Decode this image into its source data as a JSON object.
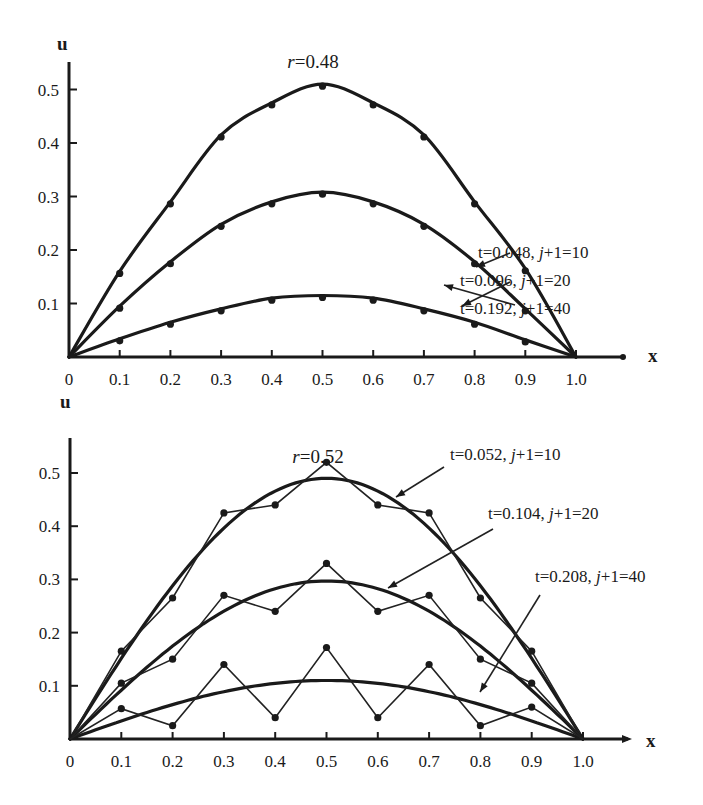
{
  "chart_data": [
    {
      "type": "line",
      "title": "r=0.48",
      "title_var": "r",
      "title_value": "=0.48",
      "xlabel": "x",
      "ylabel": "u",
      "xlim": [
        0,
        1.0
      ],
      "ylim": [
        0,
        0.55
      ],
      "x_ticks": [
        "0",
        "0.1",
        "0.2",
        "0.3",
        "0.4",
        "0.5",
        "0.6",
        "0.7",
        "0.8",
        "0.9",
        "1.0"
      ],
      "y_ticks": [
        "0.1",
        "0.2",
        "0.3",
        "0.4",
        "0.5"
      ],
      "grid": false,
      "x": [
        0,
        0.1,
        0.2,
        0.3,
        0.4,
        0.5,
        0.6,
        0.7,
        0.8,
        0.9,
        1.0
      ],
      "series": [
        {
          "name": "t=0.048, j+1=10",
          "label_t": "t=0.048, ",
          "label_j": "j",
          "label_rest": "+1=10",
          "kind": "exact+numeric",
          "values": [
            0,
            0.16,
            0.29,
            0.415,
            0.475,
            0.51,
            0.475,
            0.415,
            0.29,
            0.165,
            0
          ]
        },
        {
          "name": "t=0.096, j+1=20",
          "label_t": "t=0.096, ",
          "label_j": "j",
          "label_rest": "+1=20",
          "kind": "exact+numeric",
          "values": [
            0,
            0.095,
            0.178,
            0.248,
            0.29,
            0.308,
            0.29,
            0.248,
            0.178,
            0.09,
            0
          ]
        },
        {
          "name": "t=0.192, j+1=40",
          "label_t": "t=0.192, ",
          "label_j": "j",
          "label_rest": "+1=40",
          "kind": "exact+numeric",
          "values": [
            0,
            0.034,
            0.065,
            0.09,
            0.11,
            0.115,
            0.11,
            0.09,
            0.065,
            0.032,
            0
          ]
        }
      ]
    },
    {
      "type": "line",
      "title": "r=0.52",
      "title_var": "r",
      "title_value": "=0.52",
      "xlabel": "x",
      "ylabel": "u",
      "xlim": [
        0,
        1.0
      ],
      "ylim": [
        0,
        0.55
      ],
      "x_ticks": [
        "0",
        "0.1",
        "0.2",
        "0.3",
        "0.4",
        "0.5",
        "0.6",
        "0.7",
        "0.8",
        "0.9",
        "1.0"
      ],
      "y_ticks": [
        "0.1",
        "0.2",
        "0.3",
        "0.4",
        "0.5"
      ],
      "grid": false,
      "x": [
        0,
        0.1,
        0.2,
        0.3,
        0.4,
        0.5,
        0.6,
        0.7,
        0.8,
        0.9,
        1.0
      ],
      "series": [
        {
          "name": "t=0.052, j+1=10",
          "label_t": "t=0.052, ",
          "label_j": "j",
          "label_rest": "+1=10",
          "kind": "exact",
          "exact_peak": 0.49,
          "numeric_values": [
            0,
            0.165,
            0.265,
            0.425,
            0.44,
            0.52,
            0.44,
            0.425,
            0.265,
            0.165,
            0
          ]
        },
        {
          "name": "t=0.104, j+1=20",
          "label_t": "t=0.104, ",
          "label_j": "j",
          "label_rest": "+1=20",
          "kind": "exact",
          "exact_peak": 0.297,
          "numeric_values": [
            0,
            0.105,
            0.15,
            0.27,
            0.24,
            0.33,
            0.24,
            0.27,
            0.15,
            0.105,
            0
          ]
        },
        {
          "name": "t=0.208, j+1=40",
          "label_t": "t=0.208, ",
          "label_j": "j",
          "label_rest": "+1=40",
          "kind": "exact",
          "exact_peak": 0.11,
          "numeric_values": [
            0,
            0.057,
            0.025,
            0.14,
            0.04,
            0.172,
            0.04,
            0.14,
            0.025,
            0.06,
            0
          ]
        }
      ]
    }
  ]
}
